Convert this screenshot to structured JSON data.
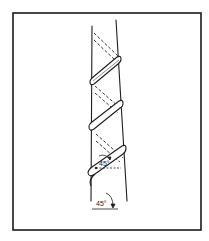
{
  "figure": {
    "colors": {
      "background": "#ffffff",
      "ink": "#1e1e1e",
      "frame": "#1a1a1a"
    },
    "frame": {
      "x": 13,
      "y": 13,
      "width": 188,
      "height": 217
    },
    "pole": {
      "left_edge": {
        "x1": 92,
        "y1": 26,
        "x2": 92,
        "y2": 201
      },
      "right_edge": {
        "x1": 116,
        "y1": 20,
        "x2": 127,
        "y2": 201
      }
    },
    "angle_labels": [
      {
        "id": "upper",
        "text": "45°",
        "x": 99,
        "y": 166
      },
      {
        "id": "lower",
        "text": "45°",
        "x": 97,
        "y": 207
      }
    ]
  }
}
